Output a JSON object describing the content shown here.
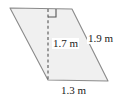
{
  "figure": {
    "shape_name": "parallelogram",
    "fill_color": "#f0f0f0",
    "stroke_color": "#8a8a8a",
    "dashed_color": "#555555",
    "label_color": "#1a1a1a",
    "labels": {
      "height": "1.7 m",
      "slant_side": "1.9 m",
      "base": "1.3 m"
    },
    "markers": {
      "right_angle": "right-angle-marker"
    },
    "geometry": {
      "top_left": [
        10,
        8
      ],
      "top_right": [
        72,
        9
      ],
      "bottom_right": [
        108,
        81
      ],
      "bottom_left": [
        48,
        80
      ],
      "height_line_top": [
        48,
        9
      ],
      "height_line_bottom": [
        48,
        80
      ]
    }
  }
}
